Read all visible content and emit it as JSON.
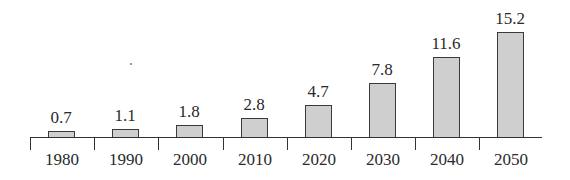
{
  "chart_data": {
    "type": "bar",
    "title": "",
    "xlabel": "",
    "ylabel": "",
    "categories": [
      "1980",
      "1990",
      "2000",
      "2010",
      "2020",
      "2030",
      "2040",
      "2050"
    ],
    "values": [
      0.7,
      1.1,
      1.8,
      2.8,
      4.7,
      7.8,
      11.6,
      15.2
    ],
    "value_labels": [
      "0.7",
      "1.1",
      "1.8",
      "2.8",
      "4.7",
      "7.8",
      "11.6",
      "15.2"
    ],
    "ylim": [
      0,
      16
    ],
    "grid": false,
    "legend": null,
    "y_axis_visible": false,
    "bar_fill": "#cfcfcf",
    "bar_edge": "#3a3a3a"
  }
}
